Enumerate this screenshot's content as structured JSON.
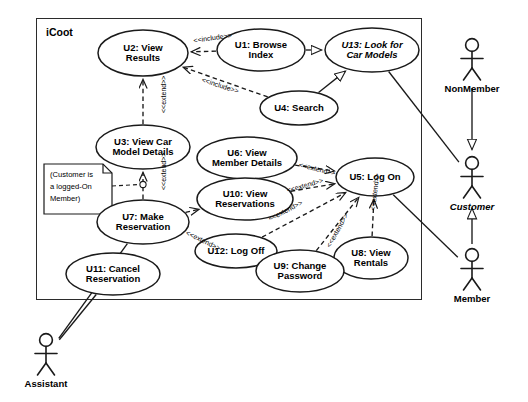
{
  "diagram": {
    "kind": "uml-use-case-diagram",
    "system_boundary": {
      "label": "iCoot",
      "x": 36,
      "y": 18,
      "width": 384,
      "height": 280
    },
    "use_cases": [
      {
        "id": "U2",
        "label": "U2: View\nResults",
        "cx": 143,
        "cy": 53,
        "rx": 45,
        "ry": 23,
        "italic": false
      },
      {
        "id": "U1",
        "label": "U1: Browse\nIndex",
        "cx": 261,
        "cy": 50,
        "rx": 44,
        "ry": 21,
        "italic": false
      },
      {
        "id": "U13",
        "label": "U13: Look for\nCar Models",
        "cx": 372,
        "cy": 50,
        "rx": 47,
        "ry": 22,
        "italic": true
      },
      {
        "id": "U4",
        "label": "U4: Search",
        "cx": 299,
        "cy": 108,
        "rx": 39,
        "ry": 17,
        "italic": false
      },
      {
        "id": "U3",
        "label": "U3: View Car\nModel Details",
        "cx": 143,
        "cy": 147,
        "rx": 47,
        "ry": 22,
        "italic": false
      },
      {
        "id": "U6",
        "label": "U6: View\nMember Details",
        "cx": 247,
        "cy": 158,
        "rx": 50,
        "ry": 21,
        "italic": false
      },
      {
        "id": "U5",
        "label": "U5: Log On",
        "cx": 375,
        "cy": 177,
        "rx": 39,
        "ry": 19,
        "italic": false
      },
      {
        "id": "U10",
        "label": "U10: View\nReservations",
        "cx": 245,
        "cy": 199,
        "rx": 48,
        "ry": 21,
        "italic": false
      },
      {
        "id": "U7",
        "label": "U7: Make\nReservation",
        "cx": 143,
        "cy": 222,
        "rx": 46,
        "ry": 22,
        "italic": false
      },
      {
        "id": "U12",
        "label": "U12: Log Off",
        "cx": 236,
        "cy": 251,
        "rx": 41,
        "ry": 17,
        "italic": false
      },
      {
        "id": "U8",
        "label": "U8: View\nRentals",
        "cx": 371,
        "cy": 258,
        "rx": 37,
        "ry": 21,
        "italic": false
      },
      {
        "id": "U9",
        "label": "U9: Change\nPassword",
        "cx": 300,
        "cy": 271,
        "rx": 44,
        "ry": 21,
        "italic": false
      },
      {
        "id": "U11",
        "label": "U11: Cancel\nReservation",
        "cx": 113,
        "cy": 274,
        "rx": 47,
        "ry": 21,
        "italic": false
      }
    ],
    "actors": [
      {
        "id": "nonmember",
        "label": "NonMember",
        "x": 472,
        "y": 45,
        "italic": false
      },
      {
        "id": "customer",
        "label": "Customer",
        "x": 472,
        "y": 163,
        "italic": true
      },
      {
        "id": "member",
        "label": "Member",
        "x": 472,
        "y": 255,
        "italic": false
      },
      {
        "id": "assistant",
        "label": "Assistant",
        "x": 46,
        "y": 340,
        "italic": false
      }
    ],
    "note": {
      "text": "(Customer is\na logged-On\nMember)",
      "x": 44,
      "y": 164,
      "width": 68,
      "height": 50
    },
    "relationships": [
      {
        "from": "U1",
        "to": "U2",
        "type": "include",
        "label": "<<include>>"
      },
      {
        "from": "U4",
        "to": "U2",
        "type": "include",
        "label": "<<include>>"
      },
      {
        "from": "U1",
        "to": "U13",
        "type": "generalization",
        "label": ""
      },
      {
        "from": "U4",
        "to": "U13",
        "type": "generalization",
        "label": ""
      },
      {
        "from": "U7",
        "to": "U3",
        "type": "extend",
        "label": "<<extend>>"
      },
      {
        "from": "U3",
        "to": "U2",
        "type": "extend",
        "label": "<<extend>>"
      },
      {
        "from": "U7",
        "to": "U10",
        "type": "extend",
        "label": "<<extend>>"
      },
      {
        "from": "U6",
        "to": "U5",
        "type": "extend",
        "label": "<<extend>>"
      },
      {
        "from": "U10",
        "to": "U5",
        "type": "extend",
        "label": "<<extend>>"
      },
      {
        "from": "U12",
        "to": "U5",
        "type": "extend",
        "label": "<<extend>>"
      },
      {
        "from": "U9",
        "to": "U5",
        "type": "extend",
        "label": "<<extend>>"
      },
      {
        "from": "U8",
        "to": "U5",
        "type": "extend",
        "label": "<<extend>>"
      },
      {
        "from": "nonmember",
        "to": "customer",
        "type": "generalization",
        "label": ""
      },
      {
        "from": "member",
        "to": "customer",
        "type": "generalization",
        "label": ""
      },
      {
        "from": "U13",
        "to": "customer",
        "type": "association",
        "label": ""
      },
      {
        "from": "U5",
        "to": "member",
        "type": "association",
        "label": ""
      },
      {
        "from": "U7",
        "to": "assistant",
        "type": "association",
        "label": ""
      },
      {
        "from": "U11",
        "to": "assistant",
        "type": "association",
        "label": ""
      }
    ],
    "relationship_labels": [
      {
        "text": "<<include>>",
        "x": 193,
        "y": 37,
        "rot": -8
      },
      {
        "text": "<<include>>",
        "x": 203,
        "y": 76,
        "rot": 18
      },
      {
        "text": "<<extend>>",
        "x": 160,
        "y": 113,
        "rot": -90
      },
      {
        "text": "<<extend>>",
        "x": 160,
        "y": 190,
        "rot": -90
      },
      {
        "text": "<<extend>>",
        "x": 188,
        "y": 229,
        "rot": 26
      },
      {
        "text": "<<extend>>",
        "x": 300,
        "y": 161,
        "rot": 14
      },
      {
        "text": "<<extend>>",
        "x": 286,
        "y": 187,
        "rot": -16
      },
      {
        "text": "<<extend>>",
        "x": 267,
        "y": 216,
        "rot": -27
      },
      {
        "text": "<<extend>>",
        "x": 325,
        "y": 245,
        "rot": -61
      },
      {
        "text": "<<extend>>",
        "x": 369,
        "y": 210,
        "rot": -83
      }
    ]
  }
}
